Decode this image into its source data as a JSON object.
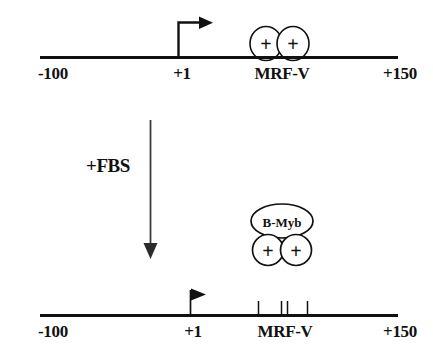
{
  "figure": {
    "title_visible": false,
    "background_color": "#ffffff",
    "stroke_color": "#111111"
  },
  "panels": [
    {
      "id": "panel-unstimulated",
      "name": "top-panel",
      "axis": {
        "name": "promoter-axis",
        "ticks": [
          {
            "label": "-100",
            "align": "left"
          },
          {
            "label": "+1",
            "align": "center"
          },
          {
            "label": "MRF-V",
            "align": "center"
          },
          {
            "label": "+150",
            "align": "right"
          }
        ]
      },
      "transcription_start": {
        "name": "transcription-start-arrow",
        "style": "bent-arrow",
        "position_label": "+1"
      },
      "complexes": [
        {
          "name": "positive-factor-circle",
          "label": "+",
          "shape": "ellipse"
        },
        {
          "name": "positive-factor-circle",
          "label": "+",
          "shape": "ellipse"
        }
      ]
    },
    {
      "id": "panel-stimulated",
      "name": "bottom-panel",
      "axis": {
        "name": "promoter-axis",
        "ticks": [
          {
            "label": "-100",
            "align": "left"
          },
          {
            "label": "+1",
            "align": "center"
          },
          {
            "label": "MRF-V",
            "align": "center"
          },
          {
            "label": "+150",
            "align": "right"
          }
        ]
      },
      "transcription_start": {
        "name": "transcription-start-flag",
        "style": "flag",
        "position_label": "+1"
      },
      "tick_marks": {
        "name": "mrf-v-site-ticks",
        "count": 4
      },
      "complexes": [
        {
          "name": "b-myb-ellipse",
          "label": "B-Myb",
          "shape": "ellipse"
        },
        {
          "name": "positive-factor-circle",
          "label": "+",
          "shape": "circle"
        },
        {
          "name": "positive-factor-circle",
          "label": "+",
          "shape": "circle"
        }
      ]
    }
  ],
  "treatment": {
    "name": "fbs-treatment",
    "label": "+FBS",
    "arrow": {
      "name": "treatment-arrow",
      "direction": "down"
    }
  }
}
